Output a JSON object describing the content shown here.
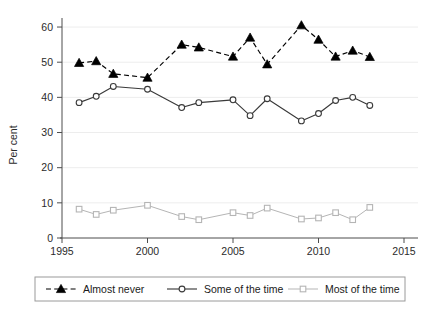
{
  "chart_data": {
    "type": "line",
    "title": "",
    "xlabel": "",
    "ylabel": "Per cent",
    "xlim": [
      1995,
      2015
    ],
    "ylim": [
      0,
      62
    ],
    "xticks": [
      1995,
      2000,
      2005,
      2010,
      2015
    ],
    "yticks": [
      0,
      10,
      20,
      30,
      40,
      50,
      60
    ],
    "grid": true,
    "legend_position": "bottom",
    "x": [
      1996,
      1997,
      1998,
      1999,
      2000,
      2002,
      2003,
      2005,
      2006,
      2007,
      2009,
      2010,
      2011,
      2012,
      2013
    ],
    "series": [
      {
        "name": "Almost never",
        "values": [
          49.8,
          50.3,
          46.7,
          null,
          45.6,
          55.0,
          54.2,
          51.6,
          57.0,
          49.4,
          60.5,
          56.4,
          51.6,
          53.3,
          51.5
        ],
        "marker": "filled-triangle",
        "linestyle": "dashed",
        "color": "#000000"
      },
      {
        "name": "Some of the time",
        "values": [
          38.5,
          40.3,
          43.1,
          null,
          42.3,
          37.1,
          38.5,
          39.3,
          34.8,
          39.6,
          33.3,
          35.4,
          39.1,
          40.0,
          37.7
        ],
        "marker": "open-circle",
        "linestyle": "solid",
        "color": "#3a3a3a"
      },
      {
        "name": "Most of the time",
        "values": [
          8.2,
          6.7,
          7.9,
          null,
          9.3,
          6.1,
          5.2,
          7.2,
          6.4,
          8.5,
          5.4,
          5.7,
          7.2,
          5.2,
          8.7
        ],
        "marker": "open-square",
        "linestyle": "solid",
        "color": "#b5b5b5"
      }
    ],
    "ytick_labels": [
      "0",
      "10",
      "20",
      "30",
      "40",
      "50",
      "60"
    ],
    "xtick_labels": [
      "1995",
      "2000",
      "2005",
      "2010",
      "2015"
    ],
    "legend_entries": [
      "Almost never",
      "Some of the time",
      "Most of the time"
    ]
  },
  "colors": {
    "series_almost_never": "#000000",
    "series_some_of_the_time": "#3a3a3a",
    "series_most_of_the_time": "#b5b5b5",
    "gridline": "#ededed",
    "axis": "#4d4d4d",
    "background": "#ffffff"
  }
}
